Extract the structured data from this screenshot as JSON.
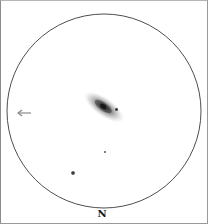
{
  "sketch": {
    "orientation_label": "N",
    "field_of_view": {
      "cx": 104,
      "cy": 111,
      "r": 97,
      "stroke": "#3a3a3a"
    },
    "galaxy": {
      "cx": 104,
      "cy": 107,
      "rx": 22,
      "ry": 8,
      "angle": 35,
      "core_color": "#1e1e1e"
    },
    "stars": [
      {
        "name": "star-near-galaxy",
        "cx": 116,
        "cy": 109,
        "r": 1.6
      },
      {
        "name": "faint-star",
        "cx": 105,
        "cy": 152,
        "r": 1.1
      },
      {
        "name": "bright-star",
        "cx": 73,
        "cy": 173,
        "r": 2.0
      }
    ],
    "direction_arrow": {
      "x1": 30,
      "y1": 113,
      "x2": 17,
      "y2": 113
    }
  }
}
